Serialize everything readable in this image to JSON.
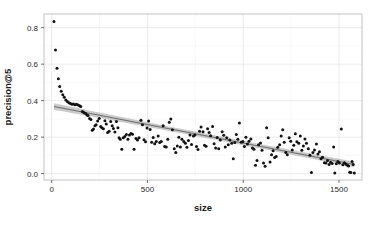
{
  "chart_data": {
    "type": "scatter",
    "title": "",
    "subtitle": "",
    "xlabel": "size",
    "ylabel": "precision@5",
    "xlim": [
      -40,
      1620
    ],
    "ylim": [
      -0.035,
      0.875
    ],
    "grid": true,
    "legend": false,
    "legend_position": "none",
    "x_ticks": [
      0,
      500,
      1000,
      1500
    ],
    "x_tick_labels": [
      "0",
      "500",
      "1000",
      "1500"
    ],
    "y_ticks": [
      0.0,
      0.2,
      0.4,
      0.6,
      0.8
    ],
    "y_tick_labels": [
      "0.0",
      "0.2",
      "0.4",
      "0.6",
      "0.8"
    ],
    "point_color": "#121212",
    "point_size": 1.9,
    "fit_line_color": "#6e6e6e",
    "ribbon_color": "#9f9f9f",
    "panel_background": "#ffffff",
    "grid_color": "#e2e2e2",
    "series": [
      {
        "name": "documents",
        "points": [
          [
            12,
            0.834
          ],
          [
            20,
            0.678
          ],
          [
            28,
            0.578
          ],
          [
            35,
            0.52
          ],
          [
            42,
            0.478
          ],
          [
            50,
            0.452
          ],
          [
            58,
            0.432
          ],
          [
            66,
            0.418
          ],
          [
            74,
            0.404
          ],
          [
            82,
            0.396
          ],
          [
            90,
            0.388
          ],
          [
            98,
            0.384
          ],
          [
            106,
            0.38
          ],
          [
            114,
            0.382
          ],
          [
            122,
            0.378
          ],
          [
            130,
            0.38
          ],
          [
            138,
            0.376
          ],
          [
            146,
            0.372
          ],
          [
            152,
            0.368
          ],
          [
            160,
            0.34
          ],
          [
            166,
            0.336
          ],
          [
            172,
            0.332
          ],
          [
            178,
            0.33
          ],
          [
            184,
            0.322
          ],
          [
            190,
            0.318
          ],
          [
            198,
            0.302
          ],
          [
            205,
            0.296
          ],
          [
            212,
            0.238
          ],
          [
            218,
            0.244
          ],
          [
            226,
            0.262
          ],
          [
            232,
            0.268
          ],
          [
            240,
            0.288
          ],
          [
            248,
            0.302
          ],
          [
            256,
            0.258
          ],
          [
            262,
            0.252
          ],
          [
            270,
            0.246
          ],
          [
            278,
            0.29
          ],
          [
            285,
            0.272
          ],
          [
            292,
            0.226
          ],
          [
            300,
            0.232
          ],
          [
            308,
            0.286
          ],
          [
            316,
            0.262
          ],
          [
            322,
            0.248
          ],
          [
            330,
            0.228
          ],
          [
            338,
            0.286
          ],
          [
            346,
            0.252
          ],
          [
            352,
            0.196
          ],
          [
            358,
            0.188
          ],
          [
            366,
            0.134
          ],
          [
            374,
            0.196
          ],
          [
            382,
            0.204
          ],
          [
            390,
            0.214
          ],
          [
            398,
            0.188
          ],
          [
            406,
            0.212
          ],
          [
            414,
            0.22
          ],
          [
            422,
            0.216
          ],
          [
            430,
            0.134
          ],
          [
            440,
            0.192
          ],
          [
            448,
            0.184
          ],
          [
            456,
            0.196
          ],
          [
            466,
            0.292
          ],
          [
            474,
            0.268
          ],
          [
            482,
            0.186
          ],
          [
            490,
            0.174
          ],
          [
            498,
            0.25
          ],
          [
            506,
            0.288
          ],
          [
            514,
            0.242
          ],
          [
            522,
            0.172
          ],
          [
            530,
            0.198
          ],
          [
            538,
            0.164
          ],
          [
            546,
            0.176
          ],
          [
            556,
            0.206
          ],
          [
            564,
            0.17
          ],
          [
            572,
            0.176
          ],
          [
            582,
            0.262
          ],
          [
            590,
            0.148
          ],
          [
            598,
            0.146
          ],
          [
            606,
            0.188
          ],
          [
            614,
            0.282
          ],
          [
            622,
            0.3
          ],
          [
            630,
            0.24
          ],
          [
            640,
            0.136
          ],
          [
            648,
            0.116
          ],
          [
            656,
            0.152
          ],
          [
            664,
            0.2
          ],
          [
            672,
            0.146
          ],
          [
            680,
            0.188
          ],
          [
            690,
            0.176
          ],
          [
            698,
            0.166
          ],
          [
            706,
            0.144
          ],
          [
            714,
            0.182
          ],
          [
            722,
            0.212
          ],
          [
            730,
            0.16
          ],
          [
            740,
            0.206
          ],
          [
            748,
            0.212
          ],
          [
            756,
            0.148
          ],
          [
            764,
            0.132
          ],
          [
            772,
            0.232
          ],
          [
            780,
            0.256
          ],
          [
            790,
            0.23
          ],
          [
            798,
            0.156
          ],
          [
            806,
            0.15
          ],
          [
            814,
            0.246
          ],
          [
            822,
            0.226
          ],
          [
            830,
            0.208
          ],
          [
            840,
            0.258
          ],
          [
            848,
            0.164
          ],
          [
            856,
            0.14
          ],
          [
            864,
            0.198
          ],
          [
            872,
            0.136
          ],
          [
            880,
            0.184
          ],
          [
            890,
            0.23
          ],
          [
            898,
            0.21
          ],
          [
            906,
            0.146
          ],
          [
            914,
            0.196
          ],
          [
            922,
            0.158
          ],
          [
            930,
            0.184
          ],
          [
            940,
            0.166
          ],
          [
            948,
            0.082
          ],
          [
            956,
            0.17
          ],
          [
            964,
            0.214
          ],
          [
            972,
            0.188
          ],
          [
            980,
            0.278
          ],
          [
            990,
            0.172
          ],
          [
            998,
            0.176
          ],
          [
            1006,
            0.148
          ],
          [
            1014,
            0.2
          ],
          [
            1022,
            0.162
          ],
          [
            1030,
            0.178
          ],
          [
            1040,
            0.19
          ],
          [
            1048,
            0.14
          ],
          [
            1056,
            0.134
          ],
          [
            1064,
            0.046
          ],
          [
            1072,
            0.072
          ],
          [
            1080,
            0.158
          ],
          [
            1090,
            0.168
          ],
          [
            1098,
            0.128
          ],
          [
            1106,
            0.058
          ],
          [
            1114,
            0.04
          ],
          [
            1122,
            0.252
          ],
          [
            1130,
            0.196
          ],
          [
            1140,
            0.064
          ],
          [
            1148,
            0.104
          ],
          [
            1156,
            0.126
          ],
          [
            1164,
            0.088
          ],
          [
            1172,
            0.094
          ],
          [
            1180,
            0.144
          ],
          [
            1190,
            0.158
          ],
          [
            1198,
            0.206
          ],
          [
            1206,
            0.24
          ],
          [
            1214,
            0.172
          ],
          [
            1222,
            0.116
          ],
          [
            1230,
            0.104
          ],
          [
            1240,
            0.196
          ],
          [
            1248,
            0.178
          ],
          [
            1256,
            0.13
          ],
          [
            1264,
            0.156
          ],
          [
            1272,
            0.218
          ],
          [
            1280,
            0.174
          ],
          [
            1290,
            0.166
          ],
          [
            1298,
            0.206
          ],
          [
            1306,
            0.128
          ],
          [
            1314,
            0.152
          ],
          [
            1322,
            0.19
          ],
          [
            1330,
            0.166
          ],
          [
            1340,
            0.136
          ],
          [
            1348,
            0.1
          ],
          [
            1356,
            0.006
          ],
          [
            1364,
            0.116
          ],
          [
            1372,
            0.13
          ],
          [
            1382,
            0.162
          ],
          [
            1390,
            0.108
          ],
          [
            1398,
            0.12
          ],
          [
            1406,
            0.082
          ],
          [
            1414,
            0.09
          ],
          [
            1424,
            0.06
          ],
          [
            1432,
            0.058
          ],
          [
            1440,
            0.072
          ],
          [
            1448,
            0.05
          ],
          [
            1456,
            0.062
          ],
          [
            1464,
            0.056
          ],
          [
            1472,
            0.146
          ],
          [
            1478,
            0.004
          ],
          [
            1486,
            0.054
          ],
          [
            1494,
            0.066
          ],
          [
            1502,
            0.058
          ],
          [
            1512,
            0.244
          ],
          [
            1520,
            0.048
          ],
          [
            1528,
            0.06
          ],
          [
            1536,
            0.052
          ],
          [
            1544,
            0.046
          ],
          [
            1550,
            0.042
          ],
          [
            1556,
            0.008
          ],
          [
            1562,
            0.006
          ],
          [
            1568,
            0.066
          ],
          [
            1574,
            0.05
          ],
          [
            1580,
            0.004
          ]
        ]
      }
    ],
    "fit": {
      "type": "linear-smooth",
      "x_start": 12,
      "x_end": 1580,
      "y_start": 0.368,
      "y_end": 0.05,
      "ci_half_width_start": 0.018,
      "ci_half_width_mid": 0.007,
      "ci_half_width_end": 0.016
    }
  }
}
